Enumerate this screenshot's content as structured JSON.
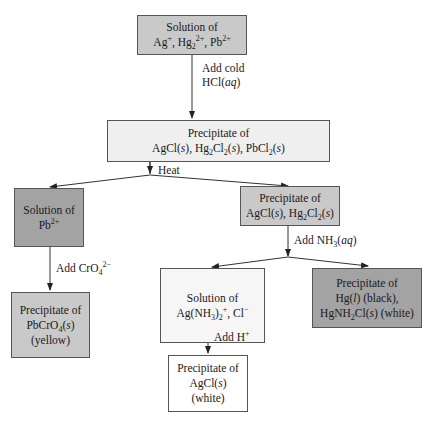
{
  "diagram": {
    "colors": {
      "medium_gray": "#c9c9c9",
      "light_gray": "#efefef",
      "dark_gray": "#a3a3a3",
      "white": "#ffffff",
      "line": "#333333"
    },
    "nodes": {
      "start": {
        "line1": "Solution of",
        "line2_html": "Ag<sup>+</sup>, Hg<sub>2</sub><sup>2+</sup>, Pb<sup>2+</sup>"
      },
      "precip_all": {
        "line1": "Precipitate of",
        "line2_html": "AgCl(<i>s</i>), Hg<sub>2</sub>Cl<sub>2</sub>(<i>s</i>), PbCl<sub>2</sub>(<i>s</i>)"
      },
      "solution_pb": {
        "line1": "Solution of",
        "line2_html": "Pb<sup>2+</sup>"
      },
      "precip_pbcro4": {
        "line1": "Precipitate of",
        "line2_html": "PbCrO<sub>4</sub>(<i>s</i>)",
        "line3": "(yellow)"
      },
      "precip_agcl_hg2cl2": {
        "line1": "Precipitate of",
        "line2_html": "AgCl(<i>s</i>), Hg<sub>2</sub>Cl<sub>2</sub>(<i>s</i>)"
      },
      "solution_agnh3": {
        "line1": "Solution of",
        "line2_html": "Ag(NH<sub>3</sub>)<sub>2</sub><sup>+</sup>, Cl<sup>−</sup>"
      },
      "precip_hg": {
        "line1": "Precipitate of",
        "line2_html": "Hg(<i>l</i>) (black),",
        "line3_html": "HgNH<sub>2</sub>Cl(<i>s</i>) (white)"
      },
      "precip_agcl": {
        "line1": "Precipitate of",
        "line2_html": "AgCl(<i>s</i>)",
        "line3": "(white)"
      }
    },
    "edge_labels": {
      "add_cold_1": "Add cold",
      "add_cold_2_html": "HCl(<i>aq</i>)",
      "heat": "Heat",
      "add_cro4_html": "Add CrO<sub>4</sub><sup>2−</sup>",
      "add_nh3_html": "Add NH<sub>3</sub>(<i>aq</i>)",
      "add_h_html": "Add H<sup>+</sup>"
    }
  }
}
